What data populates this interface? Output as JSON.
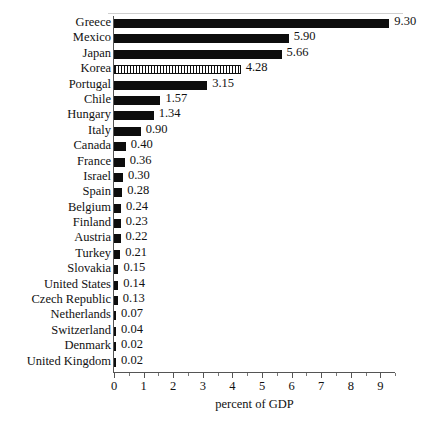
{
  "chart_data": {
    "type": "bar",
    "orientation": "horizontal",
    "title": "",
    "xlabel": "percent of GDP",
    "ylabel": "",
    "xlim": [
      0,
      9.5
    ],
    "xticks": [
      0,
      1,
      2,
      3,
      4,
      5,
      6,
      7,
      8,
      9
    ],
    "xtick_labels": [
      "0",
      "1",
      "2",
      "3",
      "4",
      "5",
      "6",
      "7",
      "8",
      "9"
    ],
    "grid": false,
    "legend": null,
    "categories": [
      "Greece",
      "Mexico",
      "Japan",
      "Korea",
      "Portugal",
      "Chile",
      "Hungary",
      "Italy",
      "Canada",
      "France",
      "Israel",
      "Spain",
      "Belgium",
      "Finland",
      "Austria",
      "Turkey",
      "Slovakia",
      "United States",
      "Czech Republic",
      "Netherlands",
      "Switzerland",
      "Denmark",
      "United Kingdom"
    ],
    "values": [
      9.3,
      5.9,
      5.66,
      4.28,
      3.15,
      1.57,
      1.34,
      0.9,
      0.4,
      0.36,
      0.3,
      0.28,
      0.24,
      0.23,
      0.22,
      0.21,
      0.15,
      0.14,
      0.13,
      0.07,
      0.04,
      0.02,
      0.02
    ],
    "value_labels": [
      "9.30",
      "5.90",
      "5.66",
      "4.28",
      "3.15",
      "1.57",
      "1.34",
      "0.90",
      "0.40",
      "0.36",
      "0.30",
      "0.28",
      "0.24",
      "0.23",
      "0.22",
      "0.21",
      "0.15",
      "0.14",
      "0.13",
      "0.07",
      "0.04",
      "0.02",
      "0.02"
    ],
    "highlighted_category": "Korea",
    "bar_fill_color": "#0d0d0d",
    "highlight_fill_pattern": "vertical-hatch",
    "axis_color": "#555555"
  }
}
